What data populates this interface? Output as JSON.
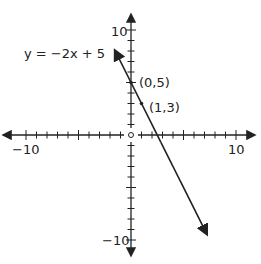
{
  "chart_data": {
    "type": "line",
    "title": "",
    "equation_label": "y = −2x + 5",
    "series": [
      {
        "name": "y = -2x + 5",
        "slope": -2,
        "intercept": 5,
        "x": [
          -1.5,
          7.2
        ],
        "y": [
          8.0,
          -9.4
        ]
      }
    ],
    "points": [
      {
        "x": 0,
        "y": 5,
        "label": "(0,5)"
      },
      {
        "x": 1,
        "y": 3,
        "label": "(1,3)"
      }
    ],
    "xlim": [
      -10,
      10
    ],
    "ylim": [
      -10,
      10
    ],
    "x_tick_labels": [
      "-10",
      "10"
    ],
    "y_tick_labels": [
      "10",
      "-10"
    ],
    "grid": false,
    "xlabel": "",
    "ylabel": ""
  },
  "labels": {
    "equation": "y = −2x + 5",
    "p1": "(0,5)",
    "p2": "(1,3)",
    "x_min": "−10",
    "x_max": "10",
    "y_max": "10",
    "y_min": "−10"
  }
}
